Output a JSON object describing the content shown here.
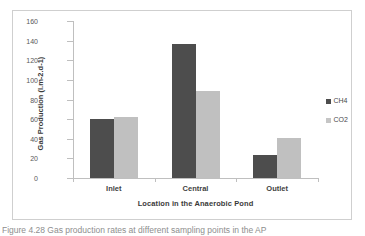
{
  "figure": {
    "caption": "Figure 4.28 Gas production rates at different sampling points in the AP"
  },
  "legend": {
    "position": "right",
    "entries": [
      {
        "label": "CH4",
        "color": "#4d4d4d"
      },
      {
        "label": "CO2",
        "color": "#c5c5c5"
      }
    ]
  },
  "chart_data": {
    "type": "bar",
    "title": "",
    "xlabel": "Location in the Anaerobic Pond",
    "ylabel": "Gas Production (l.m-2.d-1)",
    "categories": [
      "Inlet",
      "Central",
      "Outlet"
    ],
    "series": [
      {
        "name": "CH4",
        "color": "#4d4d4d",
        "values": [
          60,
          137,
          23
        ]
      },
      {
        "name": "CO2",
        "color": "#c0c0c0",
        "values": [
          62,
          89,
          41
        ]
      }
    ],
    "ylim": [
      0,
      160
    ],
    "yticks": [
      0,
      20,
      40,
      60,
      80,
      100,
      120,
      140,
      160
    ],
    "ytick_labels": [
      "0",
      "20",
      "40",
      "60",
      "80",
      "100",
      "120",
      "140",
      "160"
    ],
    "grid": false,
    "legend_position": "right"
  }
}
